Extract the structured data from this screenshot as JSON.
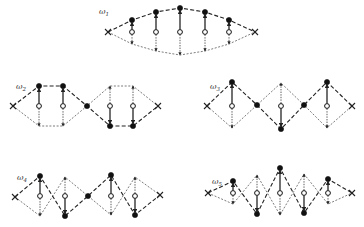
{
  "figure": {
    "modes": [
      {
        "label": "ω",
        "subscript": "1",
        "ends": [
          [
            108,
            32
          ],
          [
            255,
            32
          ]
        ],
        "equilibrium_y": 32,
        "sites": [
          {
            "x": 132,
            "filled_y": 20,
            "arrow_y": 44
          },
          {
            "x": 156,
            "filled_y": 12,
            "arrow_y": 51
          },
          {
            "x": 180,
            "filled_y": 8,
            "arrow_y": 55
          },
          {
            "x": 205,
            "filled_y": 12,
            "arrow_y": 51
          },
          {
            "x": 229,
            "filled_y": 20,
            "arrow_y": 44
          }
        ],
        "label_pos": [
          99,
          14
        ]
      },
      {
        "label": "ω",
        "subscript": "2",
        "ends": [
          [
            13,
            106
          ],
          [
            158,
            106
          ]
        ],
        "equilibrium_y": 106,
        "sites": [
          {
            "x": 39,
            "filled_y": 86,
            "arrow_y": 126
          },
          {
            "x": 63,
            "filled_y": 86,
            "arrow_y": 126
          },
          {
            "x": 87,
            "filled_y": 106,
            "arrow_y": 106,
            "node": true
          },
          {
            "x": 110,
            "filled_y": 126,
            "arrow_y": 86
          },
          {
            "x": 133,
            "filled_y": 126,
            "arrow_y": 86
          }
        ],
        "label_pos": [
          16,
          89
        ]
      },
      {
        "label": "ω",
        "subscript": "3",
        "ends": [
          [
            207,
            106
          ],
          [
            352,
            106
          ]
        ],
        "equilibrium_y": 106,
        "sites": [
          {
            "x": 232,
            "filled_y": 82,
            "arrow_y": 128
          },
          {
            "x": 257,
            "filled_y": 105,
            "arrow_y": 105,
            "node": true
          },
          {
            "x": 281,
            "filled_y": 129,
            "arrow_y": 83
          },
          {
            "x": 304,
            "filled_y": 105,
            "arrow_y": 105,
            "node": true
          },
          {
            "x": 327,
            "filled_y": 82,
            "arrow_y": 128
          }
        ],
        "label_pos": [
          210,
          89
        ]
      },
      {
        "label": "ω",
        "subscript": "4",
        "ends": [
          [
            15,
            197
          ],
          [
            160,
            195
          ]
        ],
        "equilibrium_y": 196,
        "sites": [
          {
            "x": 40,
            "filled_y": 176,
            "arrow_y": 216
          },
          {
            "x": 65,
            "filled_y": 216,
            "arrow_y": 177
          },
          {
            "x": 88,
            "filled_y": 196,
            "arrow_y": 196,
            "node": true
          },
          {
            "x": 111,
            "filled_y": 175,
            "arrow_y": 215
          },
          {
            "x": 135,
            "filled_y": 215,
            "arrow_y": 177
          }
        ],
        "label_pos": [
          17,
          180
        ]
      },
      {
        "label": "ω",
        "subscript": "5",
        "ends": [
          [
            208,
            193
          ],
          [
            352,
            193
          ]
        ],
        "equilibrium_y": 193,
        "sites": [
          {
            "x": 233,
            "filled_y": 181,
            "arrow_y": 204
          },
          {
            "x": 257,
            "filled_y": 214,
            "arrow_y": 175
          },
          {
            "x": 280,
            "filled_y": 168,
            "arrow_y": 215
          },
          {
            "x": 304,
            "filled_y": 213,
            "arrow_y": 174
          },
          {
            "x": 328,
            "filled_y": 179,
            "arrow_y": 204
          }
        ],
        "label_pos": [
          212,
          184
        ]
      }
    ]
  },
  "colors": {
    "ink": "#111111",
    "background": "#ffffff"
  }
}
